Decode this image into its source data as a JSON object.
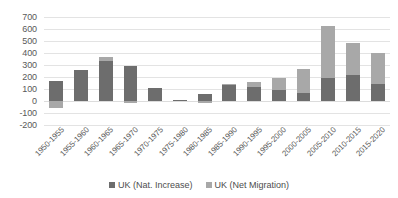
{
  "chart_data": {
    "type": "bar",
    "subtype": "stacked-bar",
    "title": "",
    "xlabel": "",
    "ylabel": "",
    "ylim": [
      -200,
      700
    ],
    "ytick_step": 100,
    "yticks": [
      700,
      600,
      500,
      400,
      300,
      200,
      100,
      0,
      -100,
      -200
    ],
    "ytick_labels": [
      "700",
      "600",
      "500",
      "400",
      "300",
      "200",
      "100",
      "0",
      "-100",
      "-200"
    ],
    "grid": true,
    "grid_axis": "y",
    "legend_position": "bottom",
    "categories": [
      "1950-1955",
      "1955-1960",
      "1960-1965",
      "1965-1970",
      "1970-1975",
      "1975-1980",
      "1980-1985",
      "1985-1990",
      "1990-1995",
      "1995-2000",
      "2000-2005",
      "2005-2010",
      "2010-2015",
      "2015-2020"
    ],
    "series": [
      {
        "name": "UK (Nat. Increase)",
        "color": "#6d6d6d",
        "values": [
          165,
          255,
          330,
          290,
          110,
          10,
          55,
          130,
          115,
          95,
          70,
          195,
          215,
          145
        ]
      },
      {
        "name": "UK (Net Migration)",
        "color": "#a8a8a8",
        "values": [
          -55,
          0,
          40,
          -15,
          0,
          0,
          -15,
          10,
          45,
          100,
          200,
          430,
          265,
          255
        ]
      }
    ],
    "totals": [
      110,
      255,
      370,
      275,
      110,
      10,
      40,
      140,
      160,
      195,
      270,
      625,
      480,
      400
    ]
  },
  "legend": {
    "items": [
      {
        "label": "UK (Nat. Increase)",
        "color": "#6d6d6d",
        "icon": "square-swatch-icon"
      },
      {
        "label": "UK (Net Migration)",
        "color": "#a8a8a8",
        "icon": "square-swatch-icon"
      }
    ]
  },
  "colors": {
    "nat_increase": "#6d6d6d",
    "net_migration": "#a8a8a8",
    "gridline": "#e3e3e3",
    "tick_text": "#595959",
    "background": "#ffffff"
  }
}
